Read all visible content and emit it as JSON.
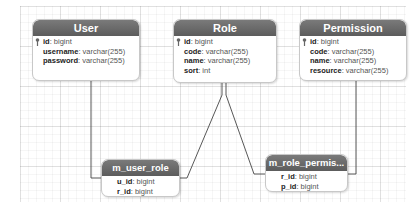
{
  "diagram": {
    "type": "er-diagram",
    "entities": [
      {
        "name": "User",
        "fields": [
          {
            "name": "id",
            "type": "bigint",
            "primary_key": true
          },
          {
            "name": "username",
            "type": "varchar(255)"
          },
          {
            "name": "password",
            "type": "varchar(255)"
          }
        ]
      },
      {
        "name": "Role",
        "fields": [
          {
            "name": "id",
            "type": "bigint",
            "primary_key": true
          },
          {
            "name": "code",
            "type": "varchar(255)"
          },
          {
            "name": "name",
            "type": "varchar(255)"
          },
          {
            "name": "sort",
            "type": "int"
          }
        ]
      },
      {
        "name": "Permission",
        "fields": [
          {
            "name": "id",
            "type": "bigint",
            "primary_key": true
          },
          {
            "name": "code",
            "type": "varchar(255)"
          },
          {
            "name": "name",
            "type": "varchar(255)"
          },
          {
            "name": "resource",
            "type": "varchar(255)"
          }
        ]
      },
      {
        "name": "m_user_role",
        "fields": [
          {
            "name": "u_id",
            "type": "bigint"
          },
          {
            "name": "r_id",
            "type": "bigint"
          }
        ]
      },
      {
        "name": "m_role_permis...",
        "fields": [
          {
            "name": "r_id",
            "type": "bigint"
          },
          {
            "name": "p_id",
            "type": "bigint"
          }
        ]
      }
    ],
    "relationships": [
      {
        "from": "User",
        "to": "m_user_role"
      },
      {
        "from": "Role",
        "to": "m_user_role"
      },
      {
        "from": "Role",
        "to": "m_role_permis..."
      },
      {
        "from": "Permission",
        "to": "m_role_permis..."
      }
    ],
    "separator": ": ",
    "colors": {
      "header": "#666666",
      "header_text": "#ffffff",
      "line": "#444444"
    }
  }
}
